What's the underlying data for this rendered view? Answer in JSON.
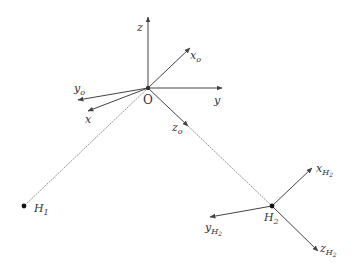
{
  "diagram": {
    "type": "coordinate-frames",
    "origin": {
      "label": "O",
      "x": 148,
      "y": 88
    },
    "points": [
      {
        "id": "H1",
        "label": "H",
        "sub": "1",
        "x": 24,
        "y": 206
      },
      {
        "id": "H2",
        "label": "H",
        "sub": "2",
        "x": 272,
        "y": 206
      }
    ],
    "frames": {
      "world": {
        "axes": [
          {
            "name": "z",
            "label": "z",
            "sub": ""
          },
          {
            "name": "y",
            "label": "y",
            "sub": ""
          },
          {
            "name": "x",
            "label": "x",
            "sub": ""
          }
        ]
      },
      "o_frame": {
        "axes": [
          {
            "name": "xo",
            "label": "x",
            "sub": "o"
          },
          {
            "name": "yo",
            "label": "y",
            "sub": "o"
          },
          {
            "name": "zo",
            "label": "z",
            "sub": "o"
          }
        ]
      },
      "h2_frame": {
        "axes": [
          {
            "name": "xH2",
            "label": "x",
            "sub": "H",
            "subsub": "2"
          },
          {
            "name": "yH2",
            "label": "y",
            "sub": "H",
            "subsub": "2"
          },
          {
            "name": "zH2",
            "label": "z",
            "sub": "H",
            "subsub": "2"
          }
        ]
      }
    },
    "line_color": "#555555"
  }
}
